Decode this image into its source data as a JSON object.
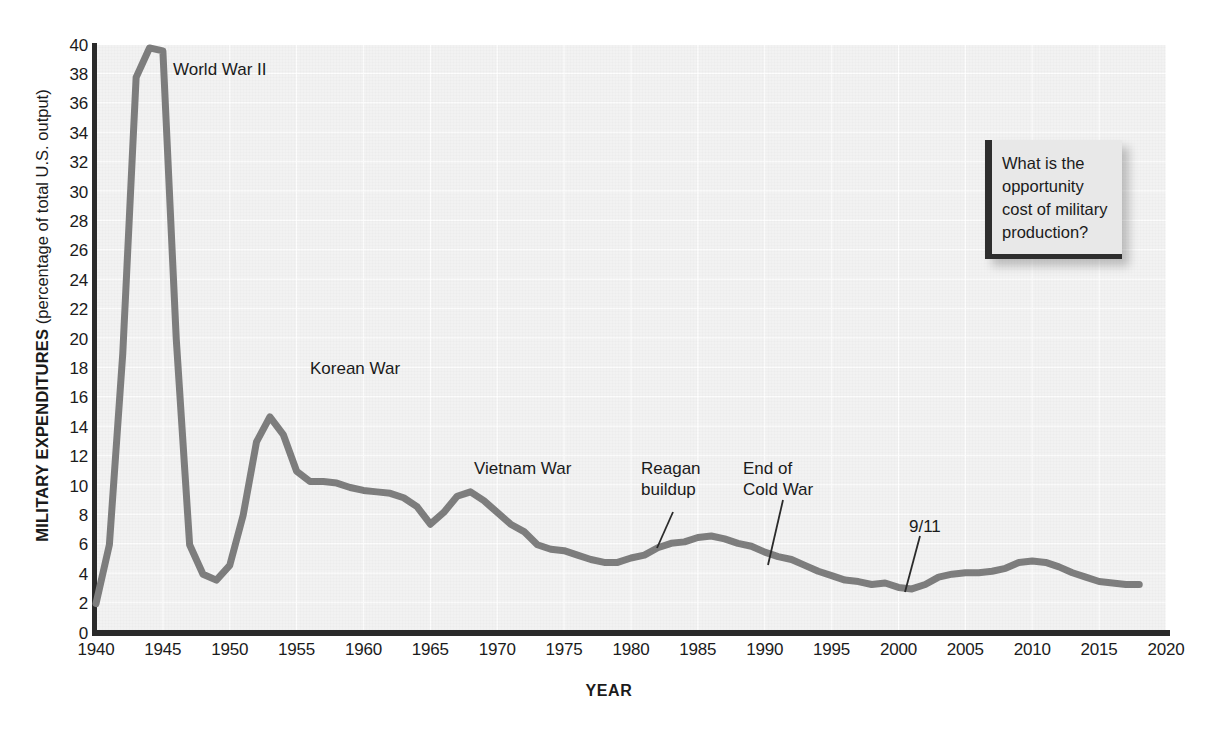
{
  "figure": {
    "background_color": "#ffffff",
    "plot_background_color": "#f2f2f2",
    "line_color": "#7d7d7d",
    "axis_color": "#2a2a2a",
    "axis_y_title_bold": "MILITARY EXPENDITURES",
    "axis_y_title_sub": " (percentage of total U.S. output)",
    "axis_x_title": "YEAR"
  },
  "callout": {
    "text": "What is the opportunity cost of military production?",
    "accent_color": "#2e2e2e",
    "background_color": "#e8e8e8"
  },
  "annotations": [
    {
      "label": "World War II",
      "x": 173,
      "y": 59,
      "leader": null
    },
    {
      "label": "Korean War",
      "x": 310,
      "y": 358,
      "leader": null
    },
    {
      "label": "Vietnam War",
      "x": 474,
      "y": 458,
      "leader": null
    },
    {
      "label": "Reagan\nbuildup",
      "x": 641,
      "y": 458,
      "leader": {
        "x1": 673,
        "y1": 512,
        "x2": 657,
        "y2": 548
      }
    },
    {
      "label": "End of\nCold War",
      "x": 743,
      "y": 458,
      "leader": {
        "x1": 783,
        "y1": 500,
        "x2": 768,
        "y2": 565
      }
    },
    {
      "label": "9/11",
      "x": 909,
      "y": 516,
      "leader": {
        "x1": 920,
        "y1": 536,
        "x2": 905,
        "y2": 592
      }
    }
  ],
  "chart_data": {
    "type": "line",
    "title": "",
    "xlabel": "YEAR",
    "ylabel": "MILITARY EXPENDITURES (percentage of total U.S. output)",
    "xlim": [
      1940,
      2020
    ],
    "ylim": [
      0,
      40
    ],
    "xticks": [
      1940,
      1945,
      1950,
      1955,
      1960,
      1965,
      1970,
      1975,
      1980,
      1985,
      1990,
      1995,
      2000,
      2005,
      2010,
      2015,
      2020
    ],
    "yticks": [
      0,
      2,
      4,
      6,
      8,
      10,
      12,
      14,
      16,
      18,
      20,
      22,
      24,
      26,
      28,
      30,
      32,
      34,
      36,
      38,
      40
    ],
    "grid": true,
    "legend": "none",
    "series": [
      {
        "name": "Military expenditures as percentage of total U.S. output",
        "x": [
          1940,
          1941,
          1942,
          1943,
          1944,
          1945,
          1946,
          1947,
          1948,
          1949,
          1950,
          1951,
          1952,
          1953,
          1954,
          1955,
          1956,
          1957,
          1958,
          1959,
          1960,
          1961,
          1962,
          1963,
          1964,
          1965,
          1966,
          1967,
          1968,
          1969,
          1970,
          1971,
          1972,
          1973,
          1974,
          1975,
          1976,
          1977,
          1978,
          1979,
          1980,
          1981,
          1982,
          1983,
          1984,
          1985,
          1986,
          1987,
          1988,
          1989,
          1990,
          1991,
          1992,
          1993,
          1994,
          1995,
          1996,
          1997,
          1998,
          1999,
          2000,
          2001,
          2002,
          2003,
          2004,
          2005,
          2006,
          2007,
          2008,
          2009,
          2010,
          2011,
          2012,
          2013,
          2014,
          2015,
          2016,
          2017,
          2018
        ],
        "y": [
          2.0,
          6.0,
          19.0,
          37.8,
          39.8,
          39.6,
          20.0,
          6.0,
          4.0,
          3.6,
          4.6,
          8.0,
          13.0,
          14.7,
          13.5,
          11.0,
          10.3,
          10.3,
          10.2,
          9.9,
          9.7,
          9.6,
          9.5,
          9.2,
          8.6,
          7.4,
          8.2,
          9.3,
          9.6,
          9.0,
          8.2,
          7.4,
          6.9,
          6.0,
          5.7,
          5.6,
          5.3,
          5.0,
          4.8,
          4.8,
          5.1,
          5.3,
          5.8,
          6.1,
          6.2,
          6.5,
          6.6,
          6.4,
          6.1,
          5.9,
          5.5,
          5.2,
          5.0,
          4.6,
          4.2,
          3.9,
          3.6,
          3.5,
          3.3,
          3.4,
          3.1,
          3.0,
          3.3,
          3.8,
          4.0,
          4.1,
          4.1,
          4.2,
          4.4,
          4.8,
          4.9,
          4.8,
          4.5,
          4.1,
          3.8,
          3.5,
          3.4,
          3.3,
          3.3
        ]
      }
    ]
  }
}
